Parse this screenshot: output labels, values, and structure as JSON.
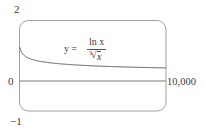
{
  "chart_data": {
    "type": "line",
    "title": "",
    "annotation": "y = ln x / ∛x",
    "annotation_parts": {
      "lhs": "y =",
      "numerator": "ln x",
      "denominator": "x",
      "root_index": "3"
    },
    "xlabel": "",
    "ylabel": "",
    "xlim": [
      0,
      10000
    ],
    "ylim": [
      -1,
      2
    ],
    "x_tick_labels": [
      "10,000"
    ],
    "y_tick_labels": [
      "2",
      "0",
      "−1"
    ],
    "grid": false,
    "legend": null,
    "series": [
      {
        "name": "y = ln x / ∛x",
        "x": [
          1,
          20,
          100,
          500,
          1000,
          2000,
          3000,
          4000,
          5000,
          6000,
          7000,
          8000,
          9000,
          10000
        ],
        "values": [
          0.0,
          1.1,
          0.99,
          0.78,
          0.69,
          0.6,
          0.56,
          0.52,
          0.5,
          0.48,
          0.46,
          0.45,
          0.44,
          0.43
        ]
      }
    ],
    "colors": {
      "frame": "#9a9a9a",
      "curve": "#555555",
      "axis": "#777777"
    }
  },
  "labels": {
    "y_top": "2",
    "y_zero": "0",
    "y_bottom": "−1",
    "x_right": "10,000",
    "eq_lhs": "y =",
    "eq_num": "ln x",
    "eq_root_index": "3",
    "eq_den": "x"
  }
}
